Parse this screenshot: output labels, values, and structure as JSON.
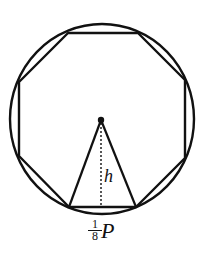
{
  "diagram": {
    "colors": {
      "stroke": "#111111",
      "background": "#ffffff"
    },
    "circle": {
      "cx": 102,
      "cy": 119,
      "rx": 92,
      "ry": 95
    },
    "octagon_vertices": [
      [
        68,
        33
      ],
      [
        138,
        33
      ],
      [
        185,
        80
      ],
      [
        185,
        158
      ],
      [
        136,
        207
      ],
      [
        69,
        207
      ],
      [
        19,
        156
      ],
      [
        19,
        82
      ]
    ],
    "center_point": {
      "x": 101,
      "y": 120
    },
    "triangle": {
      "apex": [
        101,
        120
      ],
      "base_left": [
        69,
        207
      ],
      "base_right": [
        136,
        207
      ]
    },
    "height_line": {
      "x": 101,
      "y1": 122,
      "y2": 207,
      "style": "dotted"
    },
    "labels": {
      "height": "h",
      "base_fraction_numerator": "1",
      "base_fraction_denominator": "8",
      "base_variable": "P"
    }
  }
}
